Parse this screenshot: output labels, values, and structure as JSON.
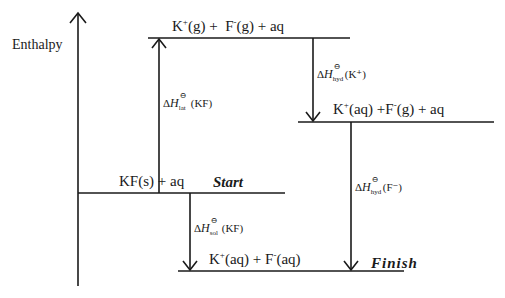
{
  "axis": {
    "label": "Enthalpy"
  },
  "levels": {
    "top": {
      "species1": "K",
      "species1_charge": "+",
      "species1_state": "(g)",
      "plus1": "+",
      "species2": "F",
      "species2_charge": "-",
      "species2_state": "(g)",
      "plus2": "+",
      "solvent": "aq"
    },
    "middle": {
      "species1": "K",
      "species1_charge": "+",
      "species1_state": "(aq)",
      "plus1": "+",
      "species2": "F",
      "species2_charge": "-",
      "species2_state": "(g)",
      "plus2": "+",
      "solvent": "aq"
    },
    "start": {
      "species": "KF(s)",
      "plus": "+",
      "solvent": "aq",
      "tag": "Start"
    },
    "finish": {
      "species1": "K",
      "species1_charge": "+",
      "species1_state": "(aq)",
      "plus": "+",
      "species2": "F",
      "species2_charge": "-",
      "species2_state": "(aq)",
      "tag": "Finish"
    }
  },
  "arrows": {
    "lattice": {
      "delta": "Δ",
      "symbol": "H",
      "standard": "⊖",
      "subscript": "lat",
      "arg": "(KF)"
    },
    "hyd_k": {
      "delta": "Δ",
      "symbol": "H",
      "standard": "⊖",
      "subscript": "hyd",
      "arg": "(K⁺)"
    },
    "solution": {
      "delta": "Δ",
      "symbol": "H",
      "standard": "⊖",
      "subscript": "sol",
      "arg": "(KF)"
    },
    "hyd_f": {
      "delta": "Δ",
      "symbol": "H",
      "standard": "⊖",
      "subscript": "hyd",
      "arg": "(F⁻)"
    }
  }
}
